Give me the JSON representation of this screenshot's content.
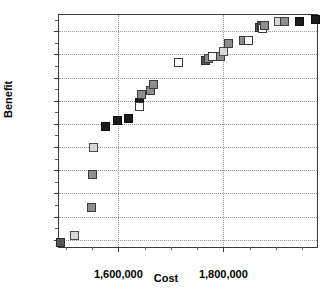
{
  "chart_data": {
    "type": "scatter",
    "title": "",
    "xlabel": "Cost",
    "ylabel": "Benefit",
    "xlim": [
      1487000,
      1982000
    ],
    "ylim": [
      308.0,
      358.5
    ],
    "grid": true,
    "legend": "none",
    "x_tick_labels": [
      "1,600,000",
      "1,800,000"
    ],
    "x_tick_values": [
      1600000,
      1800000
    ],
    "x_minor_tick_step": 50000,
    "y_tick_labels": [
      "310",
      "315",
      "320",
      "325",
      "330",
      "335",
      "340",
      "345",
      "350",
      "355"
    ],
    "y_tick_values": [
      310,
      315,
      320,
      325,
      330,
      335,
      340,
      345,
      350,
      355
    ],
    "marker": "square",
    "points": [
      {
        "x": 1490000,
        "y": 309.5,
        "fill": "dark"
      },
      {
        "x": 1516000,
        "y": 311.0,
        "fill": "light"
      },
      {
        "x": 1549000,
        "y": 316.9,
        "fill": "gray"
      },
      {
        "x": 1551000,
        "y": 324.0,
        "fill": "gray"
      },
      {
        "x": 1553000,
        "y": 329.9,
        "fill": "light"
      },
      {
        "x": 1575000,
        "y": 334.4,
        "fill": "black"
      },
      {
        "x": 1598000,
        "y": 335.7,
        "fill": "black"
      },
      {
        "x": 1620000,
        "y": 336.1,
        "fill": "black"
      },
      {
        "x": 1641000,
        "y": 339.7,
        "fill": "black"
      },
      {
        "x": 1641000,
        "y": 338.7,
        "fill": "white"
      },
      {
        "x": 1645000,
        "y": 341.4,
        "fill": "gray"
      },
      {
        "x": 1662000,
        "y": 342.2,
        "fill": "gray"
      },
      {
        "x": 1666000,
        "y": 343.5,
        "fill": "gray"
      },
      {
        "x": 1715000,
        "y": 348.3,
        "fill": "white"
      },
      {
        "x": 1766000,
        "y": 348.7,
        "fill": "dark"
      },
      {
        "x": 1772000,
        "y": 349.1,
        "fill": "gray"
      },
      {
        "x": 1779000,
        "y": 349.5,
        "fill": "white"
      },
      {
        "x": 1794000,
        "y": 349.5,
        "fill": "gray"
      },
      {
        "x": 1801000,
        "y": 350.7,
        "fill": "light"
      },
      {
        "x": 1810000,
        "y": 352.4,
        "fill": "gray"
      },
      {
        "x": 1838000,
        "y": 352.9,
        "fill": "gray"
      },
      {
        "x": 1847000,
        "y": 352.9,
        "fill": "white"
      },
      {
        "x": 1868000,
        "y": 355.7,
        "fill": "dark"
      },
      {
        "x": 1872000,
        "y": 356.2,
        "fill": "dark"
      },
      {
        "x": 1875000,
        "y": 355.6,
        "fill": "white"
      },
      {
        "x": 1878000,
        "y": 356.3,
        "fill": "gray"
      },
      {
        "x": 1905000,
        "y": 357.0,
        "fill": "light"
      },
      {
        "x": 1917000,
        "y": 357.0,
        "fill": "gray"
      },
      {
        "x": 1945000,
        "y": 357.2,
        "fill": "black"
      },
      {
        "x": 1975000,
        "y": 357.5,
        "fill": "black"
      }
    ]
  }
}
